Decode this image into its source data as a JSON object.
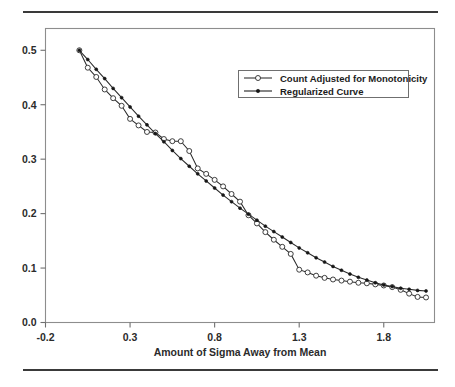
{
  "figure": {
    "top_rule": "horizontal-rule",
    "bottom_rule": "horizontal-rule"
  },
  "chart_data": {
    "type": "line",
    "title": "",
    "subtitle": "",
    "xlabel": "Amount of Sigma Away from Mean",
    "ylabel": "",
    "xlim": [
      -0.2,
      2.1
    ],
    "ylim": [
      0.0,
      0.54
    ],
    "grid": false,
    "legend_position": "upper-right",
    "xticks": [
      -0.2,
      0.3,
      0.8,
      1.3,
      1.8
    ],
    "xticklabels": [
      "-0.2",
      "0.3",
      "0.8",
      "1.3",
      "1.8"
    ],
    "yticks": [
      0.0,
      0.1,
      0.2,
      0.3,
      0.4,
      0.5
    ],
    "yticklabels": [
      "0.0",
      "0.1",
      "0.2",
      "0.3",
      "0.4",
      "0.5"
    ],
    "series": [
      {
        "name": "Count Adjusted for Monotonicity",
        "marker": "open-circle",
        "color": "#2a2a2a",
        "x": [
          0.0,
          0.05,
          0.1,
          0.15,
          0.2,
          0.25,
          0.3,
          0.35,
          0.4,
          0.45,
          0.5,
          0.55,
          0.6,
          0.65,
          0.7,
          0.75,
          0.8,
          0.85,
          0.9,
          0.95,
          1.0,
          1.05,
          1.1,
          1.15,
          1.2,
          1.25,
          1.3,
          1.35,
          1.4,
          1.45,
          1.5,
          1.55,
          1.6,
          1.65,
          1.7,
          1.75,
          1.8,
          1.85,
          1.9,
          1.95,
          2.0,
          2.05
        ],
        "y": [
          0.5,
          0.468,
          0.451,
          0.428,
          0.412,
          0.398,
          0.374,
          0.362,
          0.35,
          0.349,
          0.337,
          0.333,
          0.333,
          0.315,
          0.283,
          0.273,
          0.262,
          0.25,
          0.236,
          0.222,
          0.197,
          0.182,
          0.166,
          0.152,
          0.139,
          0.126,
          0.097,
          0.092,
          0.086,
          0.082,
          0.079,
          0.077,
          0.075,
          0.073,
          0.072,
          0.07,
          0.068,
          0.065,
          0.06,
          0.053,
          0.047,
          0.046
        ]
      },
      {
        "name": "Regularized Curve",
        "marker": "filled-dot",
        "color": "#161616",
        "x": [
          0.0,
          0.05,
          0.1,
          0.15,
          0.2,
          0.25,
          0.3,
          0.35,
          0.4,
          0.45,
          0.5,
          0.55,
          0.6,
          0.65,
          0.7,
          0.75,
          0.8,
          0.85,
          0.9,
          0.95,
          1.0,
          1.05,
          1.1,
          1.15,
          1.2,
          1.25,
          1.3,
          1.35,
          1.4,
          1.45,
          1.5,
          1.55,
          1.6,
          1.65,
          1.7,
          1.75,
          1.8,
          1.85,
          1.9,
          1.95,
          2.0,
          2.05
        ],
        "y": [
          0.5,
          0.483,
          0.465,
          0.448,
          0.43,
          0.413,
          0.396,
          0.379,
          0.363,
          0.347,
          0.332,
          0.316,
          0.301,
          0.287,
          0.273,
          0.26,
          0.247,
          0.234,
          0.222,
          0.21,
          0.199,
          0.188,
          0.177,
          0.167,
          0.157,
          0.147,
          0.137,
          0.128,
          0.119,
          0.111,
          0.103,
          0.096,
          0.089,
          0.083,
          0.078,
          0.073,
          0.069,
          0.066,
          0.063,
          0.061,
          0.059,
          0.058
        ]
      }
    ],
    "legend": [
      "Count Adjusted for Monotonicity",
      "Regularized Curve"
    ]
  }
}
